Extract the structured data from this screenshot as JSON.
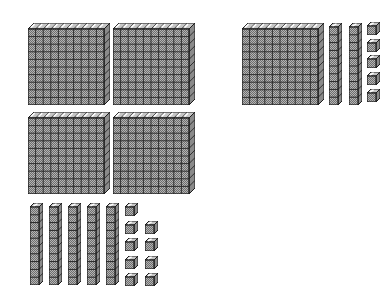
{
  "figure": {
    "type": "base-ten-blocks",
    "background": "#ffffff",
    "width": 391,
    "height": 293
  },
  "colors": {
    "outline": "#1b1b1b",
    "grid_line": "#262626",
    "front_light": "#b4b4b4",
    "front_dark": "#6e6e6e",
    "top_face": "#c6c6c6",
    "side_face": "#8a8a8a",
    "highlight": "#ffffff"
  },
  "geometry": {
    "flat": {
      "face": 76,
      "depth": 6,
      "cells": 10
    },
    "rod": {
      "face_w": 9,
      "face_h": 78,
      "depth": 4,
      "cells": 10
    },
    "cube": {
      "face": 9,
      "depth": 4
    }
  },
  "groups": [
    {
      "id": "left",
      "hundreds": 4,
      "tens": 5,
      "ones": 9,
      "value": 459,
      "flats": [
        [
          28,
          23
        ],
        [
          113,
          23
        ],
        [
          28,
          112
        ],
        [
          113,
          112
        ]
      ],
      "rods": [
        [
          30,
          203
        ],
        [
          49,
          203
        ],
        [
          68,
          203
        ],
        [
          87,
          203
        ],
        [
          106,
          203
        ]
      ],
      "cubes": [
        [
          125,
          203
        ],
        [
          125,
          221
        ],
        [
          145,
          221
        ],
        [
          125,
          238
        ],
        [
          145,
          238
        ],
        [
          125,
          256
        ],
        [
          145,
          256
        ],
        [
          125,
          273
        ],
        [
          145,
          273
        ]
      ]
    },
    {
      "id": "right",
      "hundreds": 1,
      "tens": 2,
      "ones": 5,
      "value": 125,
      "flats": [
        [
          242,
          23
        ]
      ],
      "rods": [
        [
          329,
          23
        ],
        [
          349,
          23
        ]
      ],
      "cubes": [
        [
          367,
          22
        ],
        [
          367,
          39
        ],
        [
          367,
          55
        ],
        [
          367,
          72
        ],
        [
          367,
          89
        ]
      ]
    }
  ]
}
